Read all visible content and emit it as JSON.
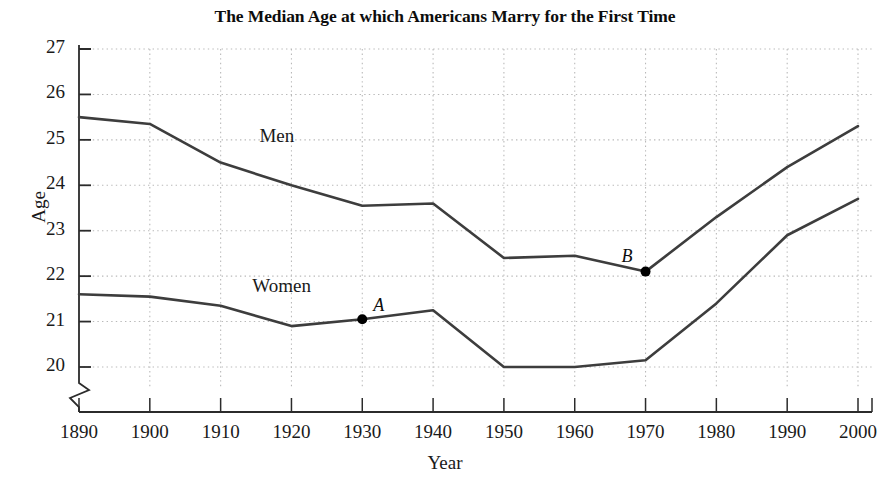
{
  "chart_data": {
    "type": "line",
    "title": "The Median Age at which Americans Marry for the First Time",
    "xlabel": "Year",
    "ylabel": "Age",
    "x": [
      1890,
      1900,
      1910,
      1920,
      1930,
      1940,
      1950,
      1960,
      1970,
      1980,
      1990,
      2000
    ],
    "xtick_labels": [
      "1890",
      "1900",
      "1910",
      "1920",
      "1930",
      "1940",
      "1950",
      "1960",
      "1970",
      "1980",
      "1990",
      "2000"
    ],
    "ytick_labels": [
      "20",
      "21",
      "22",
      "23",
      "24",
      "25",
      "26",
      "27"
    ],
    "ytick_values": [
      20,
      21,
      22,
      23,
      24,
      25,
      26,
      27
    ],
    "xlim": [
      1890,
      2000
    ],
    "ylim": [
      20,
      27
    ],
    "y_axis_break": true,
    "grid": true,
    "legend_position": "inline-labels",
    "series": [
      {
        "name": "Men",
        "label": "Men",
        "label_x": 1920,
        "label_y": 25.05,
        "values": [
          25.5,
          25.35,
          24.5,
          24.0,
          23.55,
          23.6,
          22.4,
          22.45,
          22.1,
          23.3,
          24.4,
          25.3
        ]
      },
      {
        "name": "Women",
        "label": "Women",
        "label_x": 1919,
        "label_y": 21.75,
        "values": [
          21.6,
          21.55,
          21.35,
          20.9,
          21.05,
          21.25,
          20.0,
          20.0,
          20.15,
          21.4,
          22.9,
          23.7
        ]
      }
    ],
    "annotations": [
      {
        "label": "A",
        "series": "Women",
        "x": 1930,
        "y": 21.05,
        "marker": "filled-circle",
        "label_dx": 11,
        "label_dy": -24
      },
      {
        "label": "B",
        "series": "Men",
        "x": 1970,
        "y": 22.1,
        "marker": "filled-circle",
        "label_dx": -24,
        "label_dy": -26
      }
    ],
    "colors": {
      "line": "#3d3d3d",
      "grid": "#b9b9b9",
      "axis": "#2b2b2b",
      "marker": "#000000",
      "background": "#ffffff"
    }
  }
}
